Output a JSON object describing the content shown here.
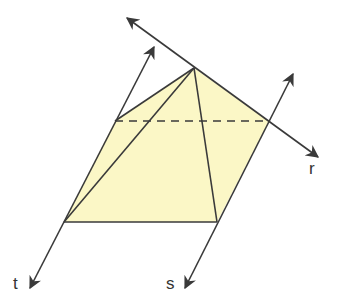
{
  "diagram": {
    "colors": {
      "fill": "#FBF7C6",
      "stroke": "#3a3a3a",
      "background": "#ffffff"
    },
    "lines": [
      {
        "id": "r",
        "label": "r"
      },
      {
        "id": "s",
        "label": "s"
      },
      {
        "id": "t",
        "label": "t"
      },
      {
        "id": "left-back",
        "label": ""
      }
    ],
    "shape": "square pyramid with hidden (dashed) back base edge"
  }
}
